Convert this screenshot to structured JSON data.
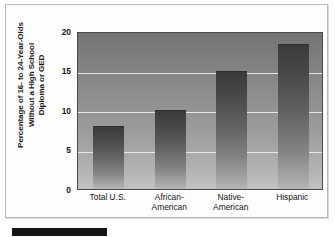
{
  "figure": {
    "y_axis_title": "Percentage of 16- to 24-Year-Olds\nWithout a High School\nDiploma or GED",
    "caption_bar_label": ""
  },
  "chart_data": {
    "type": "bar",
    "title": "",
    "subtitle": "",
    "xlabel": "",
    "ylabel": "Percentage of 16- to 24-Year-Olds Without a High School Diploma or GED",
    "categories": [
      "Total U.S.",
      "African-\nAmerican",
      "Native-\nAmerican",
      "Hispanic"
    ],
    "values": [
      8,
      10,
      15,
      18.3
    ],
    "ylim": [
      0,
      20
    ],
    "yticks": [
      0,
      5,
      10,
      15,
      20
    ],
    "ytick_labels": [
      "0",
      "5",
      "10",
      "15",
      "20"
    ],
    "grid": true,
    "gridline_values": [
      5,
      10,
      15,
      20
    ],
    "legend": [],
    "legend_position": "none",
    "colors": {
      "bar_top": "#3b3b3b",
      "bar_bottom": "#b6b6b6",
      "plot_bg_top": "#747474",
      "plot_bg_bottom": "#c2c2c2",
      "gridline": "#eeeeee",
      "axis_frame": "#4a4a4a",
      "card_bg": "#fdfdfd",
      "card_border": "#b9b9b9",
      "text": "#151515",
      "caption_bar": "#151515"
    }
  }
}
